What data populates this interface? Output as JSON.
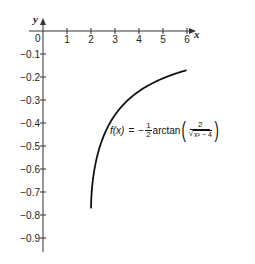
{
  "chart_data": {
    "type": "line",
    "title": "",
    "xlabel": "x",
    "ylabel": "y",
    "xlim": [
      0,
      6.3
    ],
    "ylim": [
      -0.95,
      0
    ],
    "grid": false,
    "x_ticks": [
      "0",
      "1",
      "2",
      "3",
      "4",
      "5",
      "6"
    ],
    "y_ticks": [
      "-0.1",
      "-0.2",
      "-0.3",
      "-0.4",
      "-0.5",
      "-0.6",
      "-0.7",
      "-0.8",
      "-0.9"
    ],
    "series": [
      {
        "name": "f(x) = -1/2 arctan(2/sqrt(x^2-4))",
        "x": [
          2.02,
          2.05,
          2.1,
          2.2,
          2.4,
          2.6,
          2.8,
          3.0,
          3.5,
          4.0,
          4.5,
          5.0,
          5.5,
          6.0
        ],
        "y": [
          -0.78,
          -0.76,
          -0.72,
          -0.67,
          -0.6,
          -0.55,
          -0.5,
          -0.46,
          -0.4,
          -0.31,
          -0.26,
          -0.22,
          -0.19,
          -0.17
        ]
      }
    ],
    "annotations": [
      {
        "text": "f(x) = -½ arctan(2/√(x²−4))",
        "position": [
          4.5,
          -0.42
        ]
      }
    ],
    "color": "#111111"
  },
  "labels": {
    "x_axis": "x",
    "y_axis": "y",
    "origin": "0",
    "x_ticks": [
      "1",
      "2",
      "3",
      "4",
      "5",
      "6"
    ],
    "y_ticks": [
      "−0.1",
      "−0.2",
      "−0.3",
      "−0.4",
      "−0.5",
      "−0.6",
      "−0.7",
      "−0.8",
      "−0.9"
    ]
  },
  "formula": {
    "lhs": "f(x)",
    "equals": "=",
    "minus": "−",
    "half_num": "1",
    "half_den": "2",
    "func": "arctan",
    "lparen": "(",
    "rparen": ")",
    "inner_num": "2",
    "inner_den_root": "√",
    "inner_den": "x² − 4"
  }
}
